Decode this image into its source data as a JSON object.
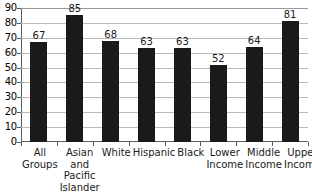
{
  "chart_data": {
    "type": "bar",
    "title": "",
    "xlabel": "",
    "ylabel": "",
    "ylim": [
      0,
      90
    ],
    "yticks": [
      90,
      80,
      70,
      60,
      50,
      40,
      30,
      20,
      10,
      0
    ],
    "grid": true,
    "legend": false,
    "bar_color": "#1a1a1a",
    "gridline_color": "#b9b9b9",
    "axis_color": "#5a5a5a",
    "categories": [
      "All Groups",
      "Asian and Pacific Islander",
      "White",
      "Hispanic",
      "Black",
      "Lower Income",
      "Middle Income",
      "Upper Income"
    ],
    "category_label_lines": [
      [
        "All",
        "Groups"
      ],
      [
        "Asian",
        "and",
        "Pacific",
        "Islander"
      ],
      [
        "White"
      ],
      [
        "Hispanic"
      ],
      [
        "Black"
      ],
      [
        "Lower",
        "Income"
      ],
      [
        "Middle",
        "Income"
      ],
      [
        "Upper",
        "Income"
      ]
    ],
    "values": [
      67,
      85,
      68,
      63,
      63,
      52,
      64,
      81
    ],
    "value_labels": [
      "67",
      "85",
      "68",
      "63",
      "63",
      "52",
      "64",
      "81"
    ]
  }
}
